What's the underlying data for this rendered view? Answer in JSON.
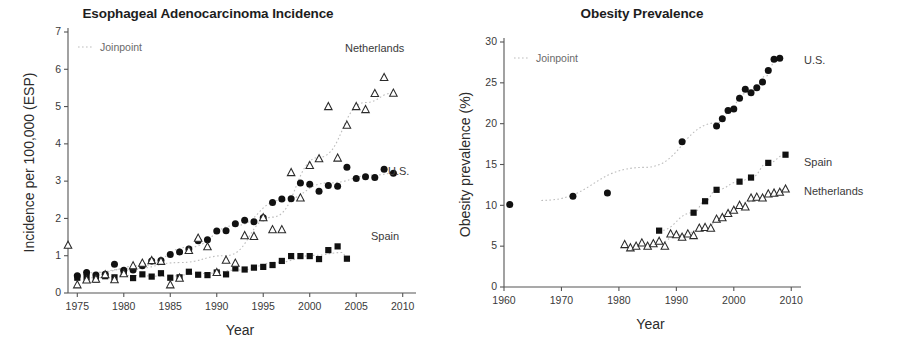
{
  "figure": {
    "panels": [
      {
        "id": "esophageal",
        "title": "Esophageal Adenocarcinoma Incidence",
        "legend_joinpoint": "Joinpoint",
        "series_labels": {
          "us": "U.S.",
          "spain": "Spain",
          "netherlands": "Netherlands"
        }
      },
      {
        "id": "obesity",
        "title": "Obesity Prevalence",
        "legend_joinpoint": "Joinpoint",
        "series_labels": {
          "us": "U.S.",
          "spain": "Spain",
          "netherlands": "Netherlands"
        }
      }
    ]
  },
  "chart_data": [
    {
      "type": "scatter",
      "title": "Esophageal Adenocarcinoma Incidence",
      "xlabel": "Year",
      "ylabel": "Incidence per 100,000 (ESP)",
      "xlim": [
        1974,
        2011
      ],
      "ylim": [
        0,
        7
      ],
      "xticks": [
        1975,
        1980,
        1985,
        1990,
        1995,
        2000,
        2005,
        2010
      ],
      "yticks": [
        0,
        1,
        2,
        3,
        4,
        5,
        6,
        7
      ],
      "grid": false,
      "legend_position": "inline-right",
      "annotations": [
        "Joinpoint"
      ],
      "series": [
        {
          "name": "U.S.",
          "marker": "filled-circle",
          "x": [
            1975,
            1976,
            1977,
            1978,
            1979,
            1980,
            1981,
            1982,
            1983,
            1984,
            1985,
            1986,
            1987,
            1988,
            1989,
            1990,
            1991,
            1992,
            1993,
            1994,
            1995,
            1996,
            1997,
            1998,
            1999,
            2000,
            2001,
            2002,
            2003,
            2004,
            2005,
            2006,
            2007,
            2008,
            2009
          ],
          "y": [
            0.46,
            0.55,
            0.48,
            0.5,
            0.77,
            0.61,
            0.62,
            0.73,
            0.86,
            0.87,
            1.03,
            1.1,
            1.18,
            1.4,
            1.43,
            1.66,
            1.67,
            1.86,
            1.95,
            1.91,
            2.02,
            2.43,
            2.52,
            2.53,
            2.95,
            2.92,
            2.73,
            2.88,
            2.86,
            3.37,
            3.07,
            3.12,
            3.1,
            3.32,
            3.21
          ]
        },
        {
          "name": "Spain",
          "marker": "filled-square",
          "x": [
            1975,
            1976,
            1977,
            1978,
            1979,
            1980,
            1981,
            1982,
            1983,
            1984,
            1985,
            1986,
            1987,
            1988,
            1989,
            1990,
            1991,
            1992,
            1993,
            1994,
            1995,
            1996,
            1997,
            1998,
            1999,
            2000,
            2001,
            2002,
            2003,
            2004
          ],
          "y": [
            0.41,
            0.42,
            0.36,
            0.45,
            0.42,
            0.56,
            0.4,
            0.5,
            0.44,
            0.53,
            0.41,
            0.42,
            0.57,
            0.49,
            0.48,
            0.55,
            0.5,
            0.66,
            0.63,
            0.68,
            0.7,
            0.75,
            0.86,
            0.99,
            0.99,
            0.99,
            0.91,
            1.15,
            1.25,
            0.92
          ]
        },
        {
          "name": "Netherlands",
          "marker": "open-triangle",
          "x": [
            1974,
            1975,
            1976,
            1977,
            1978,
            1979,
            1980,
            1981,
            1982,
            1983,
            1984,
            1985,
            1986,
            1987,
            1988,
            1989,
            1990,
            1991,
            1992,
            1993,
            1994,
            1995,
            1996,
            1997,
            1998,
            1999,
            2000,
            2001,
            2002,
            2003,
            2004,
            2005,
            2006,
            2007,
            2008,
            2009
          ],
          "y": [
            1.28,
            0.22,
            0.35,
            0.37,
            0.49,
            0.36,
            0.52,
            0.73,
            0.8,
            0.87,
            0.85,
            0.22,
            0.4,
            1.14,
            1.47,
            1.24,
            0.55,
            0.88,
            0.8,
            1.54,
            1.52,
            2.02,
            1.7,
            1.7,
            3.23,
            2.55,
            3.42,
            3.6,
            5.0,
            3.62,
            4.5,
            5.0,
            4.92,
            5.35,
            5.78,
            5.36
          ]
        }
      ]
    },
    {
      "type": "scatter",
      "title": "Obesity Prevalence",
      "xlabel": "Year",
      "ylabel": "Obesity prevalence (%)",
      "xlim": [
        1960,
        2011
      ],
      "ylim": [
        0,
        30
      ],
      "xticks": [
        1960,
        1970,
        1980,
        1990,
        2000,
        2010
      ],
      "yticks": [
        0,
        5,
        10,
        15,
        20,
        25,
        30
      ],
      "grid": false,
      "legend_position": "inline-right",
      "annotations": [
        "Joinpoint"
      ],
      "series": [
        {
          "name": "U.S.",
          "marker": "filled-circle",
          "x": [
            1961,
            1972,
            1978,
            1991,
            1997,
            1998,
            1999,
            2000,
            2001,
            2002,
            2003,
            2004,
            2005,
            2006,
            2007,
            2008
          ],
          "y": [
            10.1,
            11.1,
            11.5,
            17.8,
            19.7,
            20.6,
            21.6,
            21.8,
            23.1,
            24.2,
            23.8,
            24.4,
            25.1,
            26.5,
            27.9,
            28.0
          ]
        },
        {
          "name": "Spain",
          "marker": "filled-square",
          "x": [
            1987,
            1993,
            1995,
            1997,
            2001,
            2003,
            2006,
            2009
          ],
          "y": [
            6.9,
            9.1,
            10.5,
            11.9,
            12.9,
            13.4,
            15.2,
            16.2
          ]
        },
        {
          "name": "Netherlands",
          "marker": "open-triangle",
          "x": [
            1981,
            1982,
            1983,
            1984,
            1985,
            1986,
            1987,
            1988,
            1989,
            1990,
            1991,
            1992,
            1993,
            1994,
            1995,
            1996,
            1997,
            1998,
            1999,
            2000,
            2001,
            2002,
            2003,
            2004,
            2005,
            2006,
            2007,
            2008,
            2009
          ],
          "y": [
            5.2,
            4.8,
            5.0,
            5.4,
            5.0,
            5.3,
            5.6,
            5.0,
            6.5,
            6.4,
            6.1,
            6.5,
            6.3,
            7.2,
            7.3,
            7.2,
            8.3,
            8.5,
            9.0,
            9.4,
            10.0,
            9.8,
            10.9,
            11.0,
            10.9,
            11.4,
            11.5,
            11.6,
            12.0
          ]
        }
      ]
    }
  ]
}
